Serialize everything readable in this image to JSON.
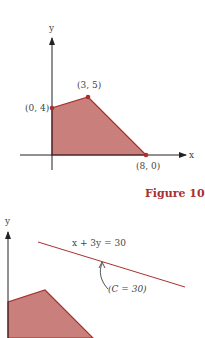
{
  "figure1": {
    "axis_x_label": "x",
    "axis_y_label": "y",
    "points": [
      {
        "label": "(0, 4)"
      },
      {
        "label": "(3, 5)"
      },
      {
        "label": "(8, 0)"
      }
    ],
    "caption": "Figure 10"
  },
  "figure2": {
    "axis_y_label": "y",
    "line_label": "x + 3y = 30",
    "annotation": "(C = 30)"
  },
  "colors": {
    "region_fill": "#c9807c",
    "edge": "#a8312f",
    "axis": "#222222"
  }
}
